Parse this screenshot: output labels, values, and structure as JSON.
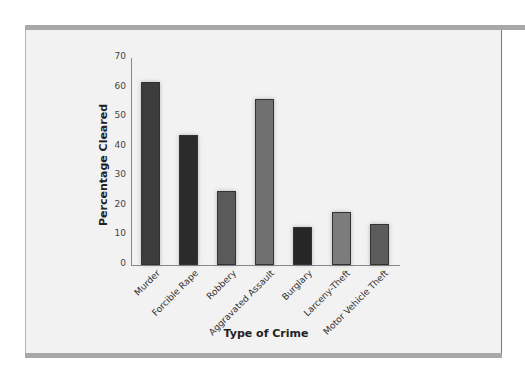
{
  "chart_data": {
    "type": "bar",
    "title": "",
    "xlabel": "Type of Crime",
    "ylabel": "Percentage Cleared",
    "ylim": [
      0,
      70
    ],
    "yticks": [
      0,
      10,
      20,
      30,
      40,
      50,
      60,
      70
    ],
    "grid": false,
    "legend": null,
    "categories": [
      "Murder",
      "Forcible Rape",
      "Robbery",
      "Aggravated Assault",
      "Burglary",
      "Larceny-Theft",
      "Motor Vehicle Theft"
    ],
    "values": [
      62,
      44,
      25,
      56,
      13,
      18,
      14
    ],
    "colors": [
      "#3c3c3c",
      "#2b2b2b",
      "#5a5a5a",
      "#707070",
      "#262626",
      "#7c7c7c",
      "#5c5c5c"
    ]
  }
}
